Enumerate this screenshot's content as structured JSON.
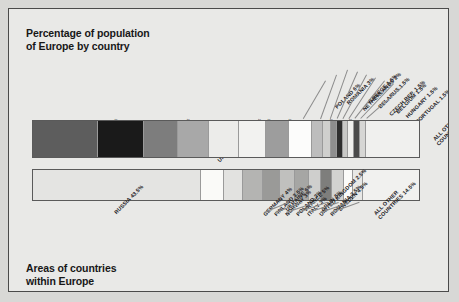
{
  "figure": {
    "background_color": "#e9e9e7",
    "border_color": "#4a4a4a",
    "page_background": "#d8d8d6"
  },
  "titles": {
    "top": "Percentage of population\nof Europe by country",
    "bottom": "Areas of countries\nwithin Europe"
  },
  "chart_data": [
    {
      "type": "bar",
      "orientation": "horizontal-stacked",
      "title": "Percentage of population of Europe by country",
      "xlabel": "",
      "ylabel": "",
      "unit": "percent",
      "total": 100,
      "categories": [
        "RUSSIA",
        "GERMANY",
        "UNITED KINGDOM",
        "FRANCE",
        "ITALY",
        "UKRAINE",
        "SPAIN",
        "POLAND",
        "ROMANIA",
        "NETHERLANDS",
        "GREECE",
        "BELARUS",
        "CZECH REP.",
        "BELGIUM",
        "HUNGARY",
        "PORTUGAL",
        "ALL OTHER COUNTRIES"
      ],
      "values": [
        17,
        12,
        9,
        8,
        8,
        7,
        6,
        6,
        3,
        2,
        1.5,
        1.5,
        1.5,
        1.5,
        1.5,
        1.5,
        14
      ],
      "labels": [
        "RUSSIA 17%",
        "GERMANY 12%",
        "UNITED KINGDOM 9%",
        "FRANCE 8%",
        "ITALY 8%",
        "UKRAINE 7%",
        "SPAIN 6%",
        "POLAND 6%",
        "ROMANIA 3%",
        "NETHERLANDS 2%",
        "GREECE 1.5%",
        "BELARUS 1.5%",
        "CZECH REP. 1.5%",
        "BELGIUM 1.5%",
        "HUNGARY 1.5%",
        "PORTUGAL 1.5%",
        "ALL OTHER\nCOUNTRIES 14%"
      ],
      "colors": [
        "#5d5d5d",
        "#1a1a1a",
        "#7d7d7d",
        "#a8a8a8",
        "#ececea",
        "#f2f2f0",
        "#9d9d9d",
        "#fcfcfb",
        "#bdbdbd",
        "#cfcfcd",
        "#8e8e8e",
        "#2e2e2e",
        "#c8c8c6",
        "#efefed",
        "#4a4a4a",
        "#d6d6d4",
        "#f0f0ee"
      ],
      "grid": false,
      "legend": "none"
    },
    {
      "type": "bar",
      "orientation": "horizontal-stacked",
      "title": "Areas of countries within Europe",
      "xlabel": "",
      "ylabel": "",
      "unit": "percent",
      "total": 100,
      "categories": [
        "RUSSIA",
        "UKRAINE",
        "FRANCE",
        "SPAIN",
        "SWEDEN",
        "GERMANY",
        "FINLAND",
        "NORWAY",
        "POLAND",
        "ITALY",
        "UNITED KINGDOM",
        "ROMANIA",
        "ALL OTHER COUNTRIES"
      ],
      "values": [
        43.5,
        6,
        5,
        5,
        4.5,
        4,
        3.5,
        3,
        3,
        3,
        2.5,
        2.5,
        14.5
      ],
      "labels": [
        "RUSSIA 43.5%",
        "UKRAINE 6%",
        "FRANCE 5%",
        "SPAIN 5%",
        "SWEDEN 4.5%",
        "GERMANY 4%",
        "FINLAND 3.5%",
        "NORWAY 3%",
        "POLAND 3%",
        "ITALY 3%",
        "UNITED KINGDOM 2.5%",
        "ROMANIA 2.5%",
        "ALL OTHER\nCOUNTRIES 14.5%"
      ],
      "colors": [
        "#e4e4e2",
        "#fafaf8",
        "#e2e2e0",
        "#b4b4b2",
        "#9a9a98",
        "#c0c0be",
        "#a6a6a4",
        "#cfcfcd",
        "#7e7e7c",
        "#d2d2d0",
        "#fbfbf9",
        "#e8e8e6",
        "#f1f1ef"
      ],
      "grid": false,
      "legend": "none"
    }
  ]
}
